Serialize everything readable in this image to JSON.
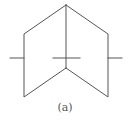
{
  "figure": {
    "caption": "(a)",
    "stroke_color": "#555555",
    "stroke_width": 1
  }
}
